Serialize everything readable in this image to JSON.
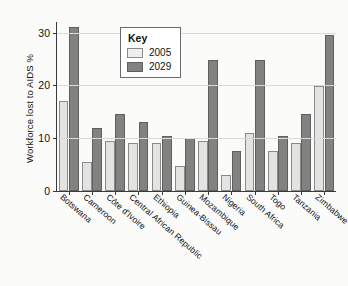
{
  "chart_data": {
    "type": "bar",
    "title": "",
    "xlabel": "",
    "ylabel": "Workforce lost to AIDS %",
    "ylim": [
      0,
      32
    ],
    "yticks": [
      0,
      10,
      20,
      30
    ],
    "ytick_labels": [
      "0",
      "10",
      "20",
      "30"
    ],
    "grid": true,
    "legend_position": "upper-center-inside",
    "legend_title": "Key",
    "categories": [
      "Botswana",
      "Cameroon",
      "Côte d'Ivoire",
      "Central African Republic",
      "Ethiopia",
      "Guinea-Bissau",
      "Mozambique",
      "Nigeria",
      "South Africa",
      "Togo",
      "Tanzania",
      "Zimbabwe"
    ],
    "series": [
      {
        "name": "2005",
        "color": "#e3e3e1",
        "values": [
          17.0,
          5.5,
          9.5,
          9.0,
          9.0,
          4.8,
          9.5,
          3.0,
          11.0,
          7.5,
          9.0,
          19.8
        ]
      },
      {
        "name": "2029",
        "color": "#828280",
        "values": [
          31.0,
          12.0,
          14.5,
          13.0,
          10.5,
          10.0,
          24.8,
          7.5,
          24.8,
          10.5,
          14.5,
          29.5
        ]
      }
    ]
  },
  "legend": {
    "title": "Key",
    "entries": [
      {
        "label": "2005"
      },
      {
        "label": "2029"
      }
    ]
  }
}
